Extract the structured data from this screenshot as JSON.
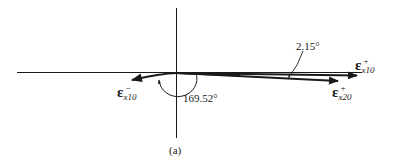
{
  "figure": {
    "caption": "(a)",
    "colors": {
      "ink": "#1a1a1a",
      "background": "#ffffff"
    },
    "axes": {
      "horizontal": true,
      "vertical": true
    },
    "vectors": [
      {
        "id": "eps-x10-minus",
        "symbol": "ε",
        "sup": "−",
        "sub": "x10",
        "direction": "left-down"
      },
      {
        "id": "eps-x10-plus",
        "symbol": "ε",
        "sup": "+",
        "sub": "x10",
        "direction": "right"
      },
      {
        "id": "eps-x20-plus",
        "symbol": "ε",
        "sup": "+",
        "sub": "x20",
        "direction": "right-down"
      }
    ],
    "angles": [
      {
        "id": "angle-large",
        "label": "169.52°"
      },
      {
        "id": "angle-small",
        "label": "2.15°"
      }
    ]
  }
}
